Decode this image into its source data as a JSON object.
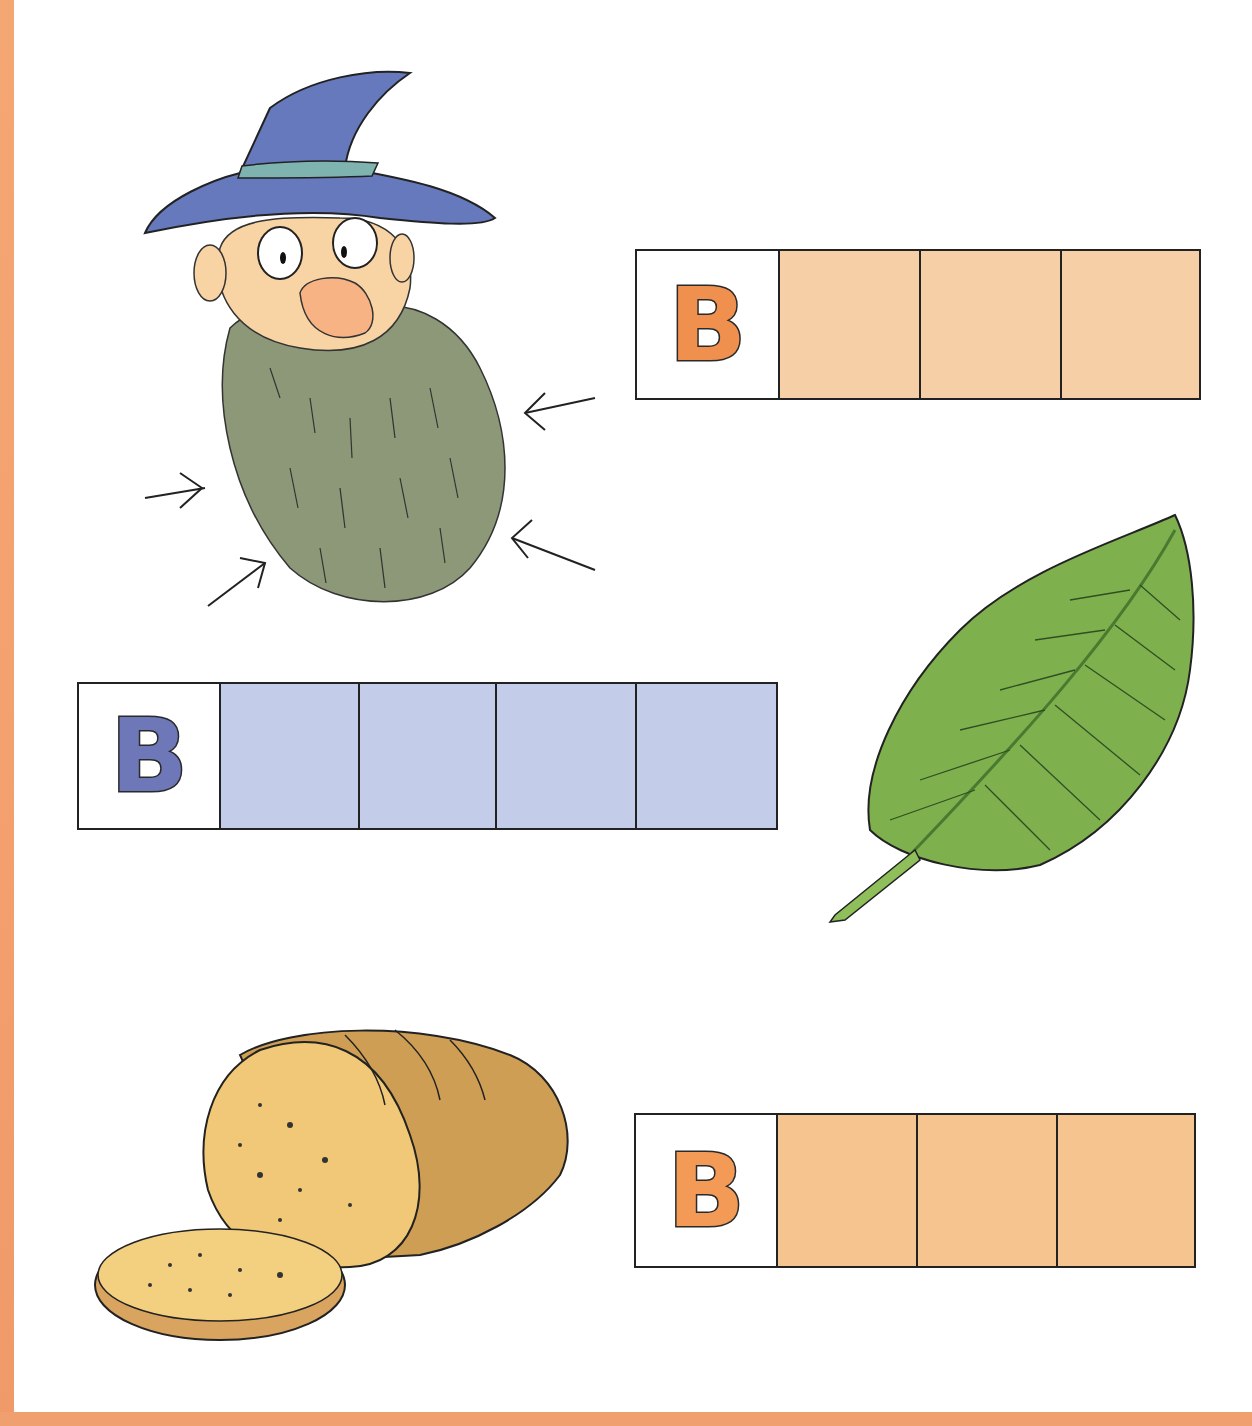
{
  "page": {
    "background": "#ffffff",
    "border_color": "#f2a06d"
  },
  "exercises": [
    {
      "id": "beard",
      "picture": "wizard-with-beard",
      "first_letter": "B",
      "blank_boxes": 3,
      "letter_color": "#f0904f",
      "box_color": "#f7cfa6"
    },
    {
      "id": "leaf",
      "picture": "green-leaf",
      "first_letter": "B",
      "blank_boxes": 4,
      "letter_color": "#6e78b8",
      "box_color": "#c3cdea"
    },
    {
      "id": "bread",
      "picture": "loaf-of-bread-with-slice",
      "first_letter": "B",
      "blank_boxes": 3,
      "letter_color": "#f29a56",
      "box_color": "#f6c48f"
    }
  ]
}
